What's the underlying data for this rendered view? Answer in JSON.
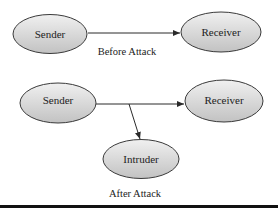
{
  "diagram": {
    "colors": {
      "node_fill_top": "#eeeeee",
      "node_fill_bottom": "#c4c4c4",
      "node_stroke": "#3a3a3a",
      "edge": "#2a2a2a",
      "text": "#222222",
      "bottom_bar": "#111111"
    },
    "before": {
      "caption": "Before Attack",
      "nodes": [
        {
          "id": "sender",
          "label": "Sender"
        },
        {
          "id": "receiver",
          "label": "Receiver"
        }
      ],
      "edges": [
        {
          "from": "sender",
          "to": "receiver"
        }
      ]
    },
    "after": {
      "caption": "After Attack",
      "nodes": [
        {
          "id": "sender",
          "label": "Sender"
        },
        {
          "id": "receiver",
          "label": "Receiver"
        },
        {
          "id": "intruder",
          "label": "Intruder"
        }
      ],
      "edges": [
        {
          "from": "sender",
          "to": "receiver"
        },
        {
          "from": "sender-receiver-edge",
          "to": "intruder"
        }
      ]
    }
  }
}
